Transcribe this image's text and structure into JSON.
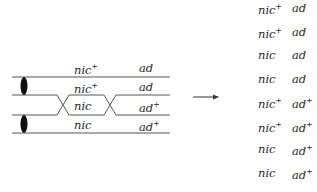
{
  "diagram": {
    "left": {
      "chromatids": [
        {
          "gene1": "nic",
          "gene1_sup": "+",
          "gene2": "ad",
          "gene2_sup": ""
        },
        {
          "gene1": "nic",
          "gene1_sup": "+",
          "gene2": "ad",
          "gene2_sup": ""
        },
        {
          "gene1": "nic",
          "gene1_sup": "",
          "gene2": "ad",
          "gene2_sup": "+"
        },
        {
          "gene1": "nic",
          "gene1_sup": "",
          "gene2": "ad",
          "gene2_sup": "+"
        }
      ],
      "crossovers": 2,
      "centromeres": 2
    },
    "arrow": "right-arrow",
    "right": {
      "products": [
        {
          "gene1": "nic",
          "gene1_sup": "+",
          "gene2": "ad",
          "gene2_sup": ""
        },
        {
          "gene1": "nic",
          "gene1_sup": "+",
          "gene2": "ad",
          "gene2_sup": ""
        },
        {
          "gene1": "nic",
          "gene1_sup": "",
          "gene2": "ad",
          "gene2_sup": ""
        },
        {
          "gene1": "nic",
          "gene1_sup": "",
          "gene2": "ad",
          "gene2_sup": ""
        },
        {
          "gene1": "nic",
          "gene1_sup": "+",
          "gene2": "ad",
          "gene2_sup": "+"
        },
        {
          "gene1": "nic",
          "gene1_sup": "+",
          "gene2": "ad",
          "gene2_sup": "+"
        },
        {
          "gene1": "nic",
          "gene1_sup": "",
          "gene2": "ad",
          "gene2_sup": "+"
        },
        {
          "gene1": "nic",
          "gene1_sup": "",
          "gene2": "ad",
          "gene2_sup": "+"
        }
      ]
    }
  }
}
